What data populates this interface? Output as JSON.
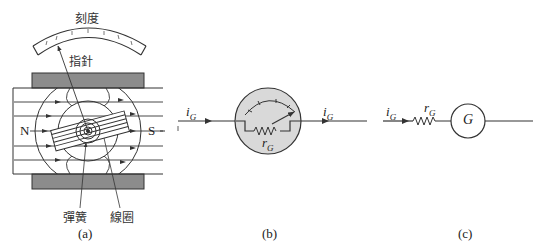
{
  "figure": {
    "panel_a": {
      "caption": "(a)",
      "labels": {
        "scale": "刻度",
        "pointer": "指針",
        "spring": "彈簧",
        "coil": "線圈",
        "north_pole": "N",
        "south_pole": "S"
      }
    },
    "panel_b": {
      "caption": "(b)",
      "labels": {
        "current_in": "i",
        "current_in_sub": "G",
        "current_out": "i",
        "current_out_sub": "G",
        "resistance": "r",
        "resistance_sub": "G"
      }
    },
    "panel_c": {
      "caption": "(c)",
      "labels": {
        "current_in": "i",
        "current_in_sub": "G",
        "resistance": "r",
        "resistance_sub": "G",
        "galvanometer": "G"
      }
    }
  }
}
